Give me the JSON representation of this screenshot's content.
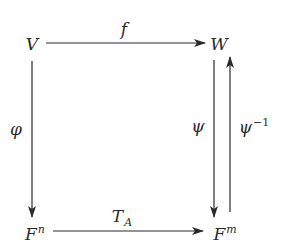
{
  "diagram": {
    "type": "commutative-diagram",
    "nodes": {
      "top_left": {
        "base": "V",
        "sup": ""
      },
      "top_right": {
        "base": "W",
        "sup": ""
      },
      "bottom_left": {
        "base": "F",
        "sup": "n"
      },
      "bottom_right": {
        "base": "F",
        "sup": "m"
      }
    },
    "arrows": {
      "top": {
        "label": "f",
        "from": "V",
        "to": "W",
        "direction": "right"
      },
      "left": {
        "label": "φ",
        "from": "V",
        "to": "F^n",
        "direction": "down"
      },
      "bottom": {
        "label_base": "T",
        "label_sub": "A",
        "from": "F^n",
        "to": "F^m",
        "direction": "right"
      },
      "right_down": {
        "label": "ψ",
        "from": "W",
        "to": "F^m",
        "direction": "down"
      },
      "right_up": {
        "label_base": "ψ",
        "label_sup": "−1",
        "from": "F^m",
        "to": "W",
        "direction": "up"
      }
    },
    "colors": {
      "line": "#2a2a2a",
      "background": "#ffffff"
    }
  }
}
